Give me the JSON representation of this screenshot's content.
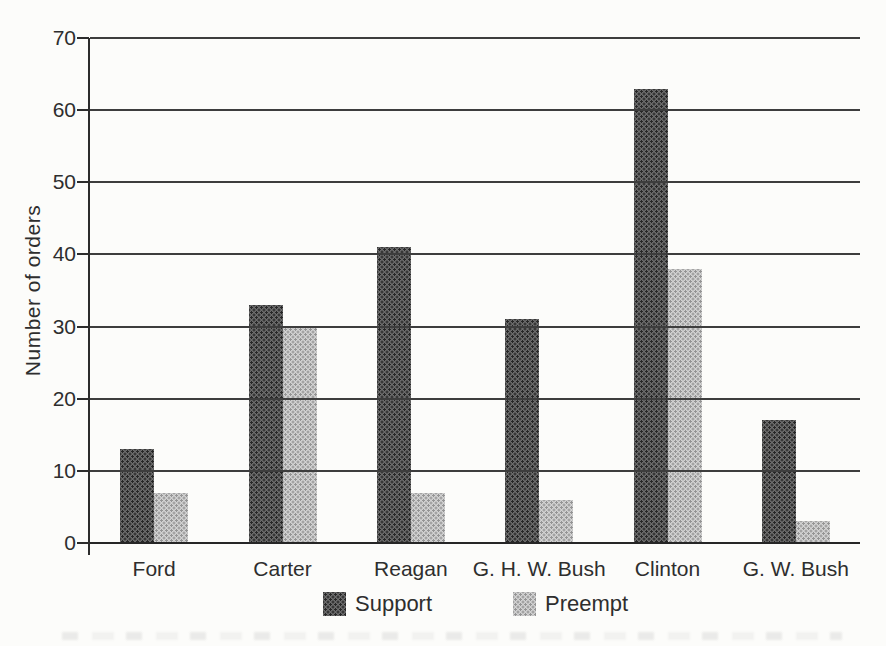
{
  "figure": {
    "background_color": "#fcfcfa",
    "ink_color": "#2c2c2c",
    "gridline_color": "#3d3d3d"
  },
  "chart_data": {
    "type": "bar",
    "title": "",
    "xlabel": "",
    "ylabel": "Number of orders",
    "ylim": [
      0,
      70
    ],
    "yticks": [
      0,
      10,
      20,
      30,
      40,
      50,
      60,
      70
    ],
    "grid": true,
    "gridlines_over_bars": true,
    "legend_position": "bottom",
    "categories": [
      "Ford",
      "Carter",
      "Reagan",
      "G. H. W. Bush",
      "Clinton",
      "G. W. Bush"
    ],
    "series": [
      {
        "name": "Support",
        "fill": "#6c6c6c",
        "dot": "#262626",
        "values": [
          13,
          33,
          41,
          31,
          63,
          17
        ]
      },
      {
        "name": "Preempt",
        "fill": "#d2d2d2",
        "dot": "#949494",
        "values": [
          7,
          30,
          7,
          6,
          38,
          3
        ]
      }
    ]
  }
}
